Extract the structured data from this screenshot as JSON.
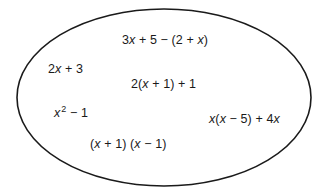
{
  "diagram": {
    "type": "set-ellipse",
    "shape": {
      "kind": "ellipse",
      "cx": 164,
      "cy": 97.5,
      "rx": 147,
      "ry": 88.5,
      "stroke": "#1a1a1a",
      "stroke_width": 1.6,
      "fill": "none"
    },
    "expressions": [
      {
        "id": "expr-1",
        "x": 122,
        "y": 33,
        "parts": [
          {
            "t": "3",
            "i": false
          },
          {
            "t": "x",
            "i": true
          },
          {
            "t": " + 5 − (2 + ",
            "i": false
          },
          {
            "t": "x",
            "i": true
          },
          {
            "t": ")",
            "i": false
          }
        ],
        "plain": "3x + 5 − (2 + x)"
      },
      {
        "id": "expr-2",
        "x": 48,
        "y": 62,
        "parts": [
          {
            "t": "2",
            "i": false
          },
          {
            "t": "x",
            "i": true
          },
          {
            "t": " + 3",
            "i": false
          }
        ],
        "plain": "2x + 3"
      },
      {
        "id": "expr-3",
        "x": 131,
        "y": 77,
        "parts": [
          {
            "t": "2(",
            "i": false
          },
          {
            "t": "x",
            "i": true
          },
          {
            "t": " + 1) + 1",
            "i": false
          }
        ],
        "plain": "2(x + 1) + 1"
      },
      {
        "id": "expr-4",
        "x": 54,
        "y": 106,
        "parts": [
          {
            "t": "x",
            "i": true
          },
          {
            "t": "2",
            "i": false,
            "sup": true
          },
          {
            "t": " − 1",
            "i": false
          }
        ],
        "plain": "x² − 1"
      },
      {
        "id": "expr-5",
        "x": 209,
        "y": 112,
        "parts": [
          {
            "t": "x",
            "i": true
          },
          {
            "t": "(",
            "i": false
          },
          {
            "t": "x",
            "i": true
          },
          {
            "t": " − 5) + 4",
            "i": false
          },
          {
            "t": "x",
            "i": true
          }
        ],
        "plain": "x(x − 5) + 4x"
      },
      {
        "id": "expr-6",
        "x": 90,
        "y": 137,
        "parts": [
          {
            "t": "(",
            "i": false
          },
          {
            "t": "x",
            "i": true
          },
          {
            "t": " + 1) (",
            "i": false
          },
          {
            "t": "x",
            "i": true
          },
          {
            "t": " − 1)",
            "i": false
          }
        ],
        "plain": "(x + 1) (x − 1)"
      }
    ]
  }
}
